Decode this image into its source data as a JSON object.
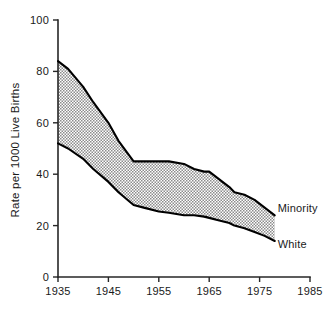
{
  "chart_data": {
    "type": "area",
    "title": "",
    "subtitle": "",
    "xlabel": "",
    "ylabel": "Rate per 1000 Live Births",
    "xlim": [
      1935,
      1985
    ],
    "ylim": [
      0,
      100
    ],
    "grid": false,
    "legend_position": "right-inline-labels",
    "x_ticks": [
      "1935",
      "1945",
      "1955",
      "1965",
      "1975",
      "1985"
    ],
    "x_tick_values": [
      1935,
      1945,
      1955,
      1965,
      1975,
      1985
    ],
    "y_ticks": [
      "0",
      "20",
      "40",
      "60",
      "80",
      "100"
    ],
    "y_tick_values": [
      0,
      20,
      40,
      60,
      80,
      100
    ],
    "annotations": [
      {
        "text": "Minority",
        "x": 1978,
        "y": 27
      },
      {
        "text": "White",
        "x": 1978,
        "y": 13
      }
    ],
    "shaded_band": {
      "between": [
        "Minority",
        "White"
      ],
      "fill": "#9a9a9a",
      "pattern": "stipple-checker"
    },
    "x": [
      1935,
      1937,
      1940,
      1942,
      1945,
      1947,
      1950,
      1952,
      1955,
      1957,
      1960,
      1962,
      1964,
      1965,
      1967,
      1969,
      1970,
      1972,
      1974,
      1976,
      1978
    ],
    "series": [
      {
        "name": "Minority",
        "color": "#000000",
        "values": [
          84,
          81,
          74,
          68,
          60,
          53,
          45,
          45,
          45,
          45,
          44,
          42,
          41,
          41,
          38,
          35,
          33,
          32,
          30,
          27,
          24
        ]
      },
      {
        "name": "White",
        "color": "#000000",
        "values": [
          52,
          50,
          46,
          42,
          37,
          33,
          28,
          27,
          25.5,
          25,
          24,
          24,
          23.5,
          23,
          22,
          21,
          20,
          19,
          17.5,
          16,
          14
        ]
      }
    ]
  },
  "axis": {
    "y_title": "Rate per 1000 Live Births"
  },
  "colors": {
    "band_fill": "#9a9a9a",
    "line": "#000000",
    "axis": "#262626",
    "text": "#1a1a1a",
    "background": "#ffffff"
  }
}
